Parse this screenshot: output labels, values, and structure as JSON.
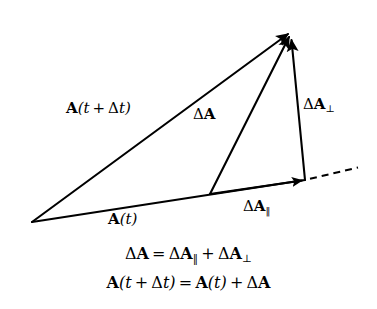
{
  "figure": {
    "background_color": "#ffffff",
    "stroke_color": "#000000",
    "labels": {
      "a_t_plus_dt": "A(t+Δt)",
      "delta_a": "ΔA",
      "delta_a_perp_base": "ΔA",
      "delta_a_perp_sub": "⊥",
      "delta_a_par_base": "ΔA",
      "delta_a_par_sub": "‖",
      "a_t": "A(t)"
    },
    "equations": {
      "line1": "ΔA = ΔA‖ + ΔA⊥",
      "line2": "A(t+Δt) = A(t) + ΔA",
      "line1_parts": {
        "lhs_base": "ΔA",
        "equals": "=",
        "term1_base": "ΔA",
        "term1_sub": "‖",
        "plus": "+",
        "term2_base": "ΔA",
        "term2_sub": "⊥"
      },
      "line2_parts": {
        "lhs": "A(t+Δt)",
        "equals": "=",
        "rhs1": "A(t)",
        "plus": "+",
        "rhs2": "ΔA"
      }
    },
    "vectors": [
      {
        "name": "a-t-plus-delta-t",
        "label": "A(t+Δt)",
        "from": [
          32,
          222
        ],
        "to": [
          290,
          32
        ],
        "arrowhead": "end",
        "style": "solid"
      },
      {
        "name": "a-t",
        "label": "A(t)",
        "from": [
          32,
          222
        ],
        "to": [
          305,
          180
        ],
        "arrowhead": "mid",
        "mid_arrow_at": [
          195,
          196
        ],
        "style": "solid"
      },
      {
        "name": "delta-a",
        "label": "ΔA",
        "from": [
          210,
          194
        ],
        "to": [
          290,
          34
        ],
        "arrowhead": "end",
        "style": "solid"
      },
      {
        "name": "delta-a-parallel",
        "label": "ΔA‖",
        "from": [
          210,
          194
        ],
        "to": [
          305,
          180
        ],
        "arrowhead": "end",
        "style": "solid"
      },
      {
        "name": "delta-a-perpendicular",
        "label": "ΔA⊥",
        "from": [
          305,
          180
        ],
        "to": [
          291,
          36
        ],
        "arrowhead": "end",
        "style": "solid"
      },
      {
        "name": "baseline-extension",
        "label": "",
        "from": [
          308,
          179
        ],
        "to": [
          358,
          167
        ],
        "arrowhead": "none",
        "style": "dashed"
      }
    ]
  }
}
